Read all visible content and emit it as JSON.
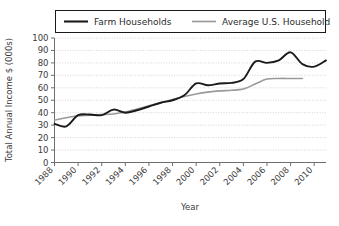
{
  "chart_data": {
    "type": "line",
    "title": "",
    "xlabel": "Year",
    "ylabel": "Total Annual Income $ (000s)",
    "xlim": [
      1988,
      2011
    ],
    "ylim": [
      0,
      100
    ],
    "ytick_step": 10,
    "xtick_step": 2,
    "grid": true,
    "legend_position": "top",
    "yticks": [
      "0",
      "10",
      "20",
      "30",
      "40",
      "50",
      "60",
      "70",
      "80",
      "90",
      "100"
    ],
    "xticks": [
      "1988",
      "1990",
      "1992",
      "1994",
      "1996",
      "1998",
      "2000",
      "2002",
      "2004",
      "2006",
      "2008",
      "2010"
    ],
    "series": [
      {
        "name": "Farm Households",
        "color": "#1a1a1a",
        "width": 1.9,
        "x": [
          1988,
          1989,
          1990,
          1991,
          1992,
          1993,
          1994,
          1995,
          1996,
          1997,
          1998,
          1999,
          2000,
          2001,
          2002,
          2003,
          2004,
          2005,
          2006,
          2007,
          2008,
          2009,
          2010,
          2011
        ],
        "values": [
          31,
          29,
          38,
          38.5,
          38,
          42.5,
          40,
          42,
          45,
          48,
          50,
          54,
          63.5,
          62,
          63.5,
          64,
          67,
          81,
          80,
          82,
          88.5,
          79,
          77,
          82
        ]
      },
      {
        "name": "Average U.S. Household",
        "color": "#9a9a9a",
        "width": 1.6,
        "x": [
          1988,
          1989,
          1990,
          1991,
          1992,
          1993,
          1994,
          1995,
          1996,
          1997,
          1998,
          1999,
          2000,
          2001,
          2002,
          2003,
          2004,
          2005,
          2006,
          2007,
          2008,
          2009
        ],
        "values": [
          34,
          36,
          37.5,
          38,
          38.5,
          39,
          40.5,
          43,
          45.5,
          48,
          50.5,
          53,
          55,
          56.5,
          57.5,
          58,
          59,
          63,
          67,
          67.5,
          67.5,
          67.5
        ]
      }
    ]
  },
  "legend": {
    "items": [
      {
        "label": "Farm Households"
      },
      {
        "label": "Average U.S. Household"
      }
    ]
  },
  "axes": {
    "y_title": "Total Annual Income $ (000s)",
    "x_title": "Year"
  }
}
